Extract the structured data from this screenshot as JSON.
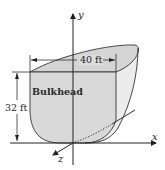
{
  "diagram": {
    "labels": {
      "bulkhead": "Bulkhead",
      "width": "40 ft",
      "height": "32 ft",
      "x_axis": "x",
      "y_axis": "y",
      "z_axis": "z"
    },
    "colors": {
      "face_fill": "#d9d9d9",
      "side_fill": "#ececec",
      "outline": "#333333",
      "background": "#ffffff"
    }
  }
}
